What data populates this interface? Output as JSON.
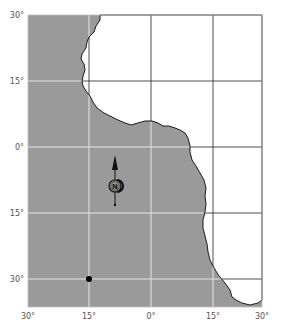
{
  "map": {
    "colors": {
      "ocean": "#9a9a9a",
      "land": "#ffffff",
      "coastline": "#1a1a1a",
      "grid_over_ocean": "#e6e6e6",
      "grid_over_land": "#222222",
      "label": "#555555",
      "marker": "#000000"
    },
    "lat_labels": [
      "30°",
      "15°",
      "0°",
      "15°",
      "30°"
    ],
    "lon_labels": [
      "30°",
      "15°",
      "0°",
      "15°",
      "30°"
    ],
    "compass": {
      "icon": "north-arrow-icon",
      "letter": "N"
    },
    "marker": {
      "icon": "location-dot-icon",
      "lat": "30° S",
      "lon": "15° W"
    }
  }
}
